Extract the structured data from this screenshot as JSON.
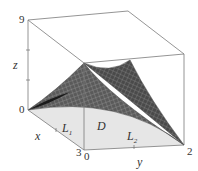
{
  "figure": {
    "type": "3d-surface-plot",
    "axes": {
      "z": {
        "label": "z",
        "top_tick": "9",
        "bottom_tick": "0"
      },
      "x": {
        "label": "x",
        "end_tick": "3"
      },
      "y": {
        "label": "y",
        "start_tick": "0",
        "end_tick": "2"
      }
    },
    "region_labels": {
      "domain": "D",
      "line1": "L",
      "line1_sub": "1",
      "line2": "L",
      "line2_sub": "2"
    },
    "colors": {
      "box_line": "#7a7a7a",
      "surface_dark": "#3a3a3a",
      "surface_mid": "#6e6e6e",
      "mesh_line": "#9a9a9a",
      "domain_fill": "#e6e6e6",
      "axis_text": "#333333"
    }
  }
}
